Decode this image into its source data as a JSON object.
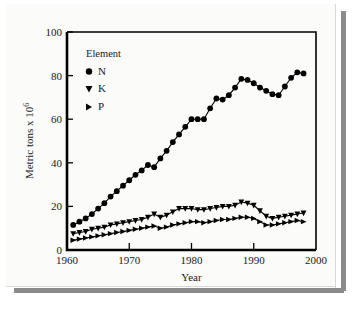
{
  "figure": {
    "background_color": "#fbfbfa",
    "shadow_color": "#8a8a8a",
    "axis_color": "#000000"
  },
  "legend": {
    "title": "Element",
    "entries": [
      {
        "label": "N",
        "marker": "filled-circle-marker"
      },
      {
        "label": "K",
        "marker": "filled-triangle-down-marker"
      },
      {
        "label": "P",
        "marker": "filled-triangle-right-marker"
      }
    ]
  },
  "axes": {
    "x_label": "Year",
    "y_label_main": "Metric tons x 10",
    "y_label_exponent": "6",
    "x_ticks": [
      "1960",
      "1970",
      "1980",
      "1990",
      "2000"
    ],
    "y_ticks": [
      "0",
      "20",
      "40",
      "60",
      "80",
      "100"
    ]
  },
  "chart_data": {
    "type": "line",
    "title": "",
    "subtitle": "",
    "xlabel": "Year",
    "ylabel": "Metric tons x 10^6",
    "xlim": [
      1960,
      2000
    ],
    "ylim": [
      0,
      100
    ],
    "xticks": [
      1960,
      1970,
      1980,
      1990,
      2000
    ],
    "yticks": [
      0,
      20,
      40,
      60,
      80,
      100
    ],
    "grid": false,
    "legend_position": "upper-left-inside",
    "legend_title": "Element",
    "x": [
      1961,
      1962,
      1963,
      1964,
      1965,
      1966,
      1967,
      1968,
      1969,
      1970,
      1971,
      1972,
      1973,
      1974,
      1975,
      1976,
      1977,
      1978,
      1979,
      1980,
      1981,
      1982,
      1983,
      1984,
      1985,
      1986,
      1987,
      1988,
      1989,
      1990,
      1991,
      1992,
      1993,
      1994,
      1995,
      1996,
      1997,
      1998
    ],
    "series": [
      {
        "name": "N",
        "marker": "filled-circle",
        "values": [
          11.5,
          13.0,
          14.5,
          16.5,
          19.0,
          21.5,
          24.5,
          27.0,
          29.5,
          32.0,
          34.5,
          36.5,
          39.0,
          38.0,
          42.0,
          45.5,
          49.5,
          53.0,
          56.5,
          60.0,
          60.0,
          60.0,
          65.0,
          69.5,
          69.0,
          71.0,
          74.5,
          78.5,
          78.0,
          76.5,
          74.5,
          73.0,
          71.5,
          71.0,
          75.0,
          79.0,
          81.5,
          81.0
        ]
      },
      {
        "name": "K",
        "marker": "filled-triangle-down",
        "values": [
          7.5,
          8.0,
          8.5,
          9.5,
          10.0,
          10.5,
          11.5,
          12.0,
          12.5,
          13.0,
          13.5,
          14.0,
          15.0,
          16.5,
          15.0,
          16.0,
          17.5,
          19.0,
          19.0,
          19.0,
          18.5,
          18.5,
          19.0,
          19.5,
          20.0,
          20.0,
          20.5,
          22.0,
          21.5,
          20.5,
          18.0,
          15.5,
          14.5,
          15.0,
          15.5,
          16.0,
          16.5,
          17.0
        ]
      },
      {
        "name": "P",
        "marker": "filled-triangle-right",
        "values": [
          4.5,
          5.0,
          5.5,
          6.0,
          6.5,
          7.0,
          7.5,
          8.0,
          8.5,
          9.0,
          9.5,
          10.0,
          10.5,
          11.0,
          10.0,
          10.5,
          11.5,
          12.0,
          12.5,
          13.0,
          13.0,
          12.5,
          13.0,
          13.5,
          14.0,
          14.0,
          14.5,
          15.0,
          15.0,
          14.5,
          13.0,
          11.5,
          11.5,
          12.0,
          12.5,
          13.0,
          13.5,
          13.0
        ]
      }
    ]
  }
}
